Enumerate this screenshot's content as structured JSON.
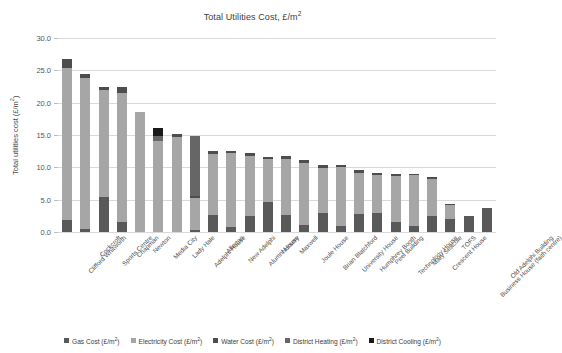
{
  "chart_data": {
    "type": "bar",
    "stacked": true,
    "xlabel": "",
    "ylabel": "Total utilities cost (£/m²)",
    "ylim": [
      0,
      30
    ],
    "yticks": [
      "0.0",
      "5.0",
      "10.0",
      "15.0",
      "20.0",
      "25.0",
      "30.0"
    ],
    "ytick_values": [
      0,
      5,
      10,
      15,
      20,
      25,
      30
    ],
    "grid": true,
    "legend_position": "bottom",
    "categories": [
      "Clifford Whitworth",
      "Cockcroft",
      "Sports Centre",
      "Chapman",
      "Newton",
      "Media City",
      "Lady Hale",
      "Adelphi House",
      "Allerton",
      "New Adelphi",
      "Alumni House",
      "Nursery",
      "Maxwell",
      "Joule House",
      "Brian Blatchford",
      "University House",
      "Humphrey Booth",
      "Peel Building",
      "Technology House",
      "Mary Seacole",
      "Crescent House",
      "TOFS",
      "Business House (faith centre)",
      "Old Adelphi Building"
    ],
    "series": [
      {
        "name": "Gas Cost (£/m²)",
        "color": "#595959",
        "values": [
          1.8,
          0.5,
          5.4,
          1.6,
          0.0,
          0.0,
          0.0,
          0.3,
          2.7,
          0.8,
          2.4,
          4.7,
          2.6,
          1.1,
          3.0,
          1.0,
          2.8,
          2.9,
          1.5,
          0.9,
          2.5,
          2.0,
          2.4,
          3.7
        ]
      },
      {
        "name": "Electricity Cost (£/m²)",
        "color": "#a6a6a6",
        "values": [
          23.5,
          23.3,
          16.6,
          19.9,
          18.6,
          14.0,
          14.7,
          4.9,
          9.4,
          11.4,
          9.4,
          6.6,
          8.7,
          9.6,
          6.9,
          9.1,
          6.4,
          5.9,
          7.1,
          7.9,
          5.7,
          2.2,
          0.0,
          0.0
        ]
      },
      {
        "name": "Water Cost (£/m²)",
        "color": "#4d4d4d",
        "values": [
          1.5,
          0.6,
          0.4,
          1.0,
          0.0,
          0.0,
          0.5,
          0.4,
          0.4,
          0.3,
          0.4,
          0.3,
          0.5,
          0.5,
          0.4,
          0.3,
          0.4,
          0.4,
          0.3,
          0.2,
          0.3,
          0.2,
          0.0,
          0.0
        ]
      },
      {
        "name": "District Heating (£/m²)",
        "color": "#666666",
        "values": [
          0.0,
          0.0,
          0.0,
          0.0,
          0.0,
          0.8,
          0.0,
          9.3,
          0.0,
          0.0,
          0.0,
          0.0,
          0.0,
          0.0,
          0.0,
          0.0,
          0.0,
          0.0,
          0.0,
          0.0,
          0.0,
          0.0,
          0.0,
          0.0
        ]
      },
      {
        "name": "District Cooling (£/m²)",
        "color": "#1a1a1a",
        "values": [
          0.0,
          0.0,
          0.0,
          0.0,
          0.0,
          1.3,
          0.0,
          0.0,
          0.0,
          0.0,
          0.0,
          0.0,
          0.0,
          0.0,
          0.0,
          0.0,
          0.0,
          0.0,
          0.0,
          0.0,
          0.0,
          0.0,
          0.0,
          0.0
        ]
      }
    ],
    "totals": [
      26.8,
      24.4,
      22.4,
      22.5,
      18.6,
      16.1,
      15.2,
      14.9,
      12.5,
      12.5,
      12.2,
      11.6,
      11.8,
      11.2,
      10.3,
      10.4,
      9.6,
      9.2,
      8.9,
      9.0,
      8.5,
      4.4,
      2.4,
      3.7
    ]
  },
  "legend": {
    "items": [
      {
        "label": "Gas Cost (£/m²)",
        "color": "#595959"
      },
      {
        "label": "Electricity Cost (£/m²)",
        "color": "#a6a6a6"
      },
      {
        "label": "Water Cost (£/m²)",
        "color": "#4d4d4d"
      },
      {
        "label": "District Heating (£/m²)",
        "color": "#666666"
      },
      {
        "label": "District Cooling (£/m²)",
        "color": "#1a1a1a"
      }
    ]
  }
}
